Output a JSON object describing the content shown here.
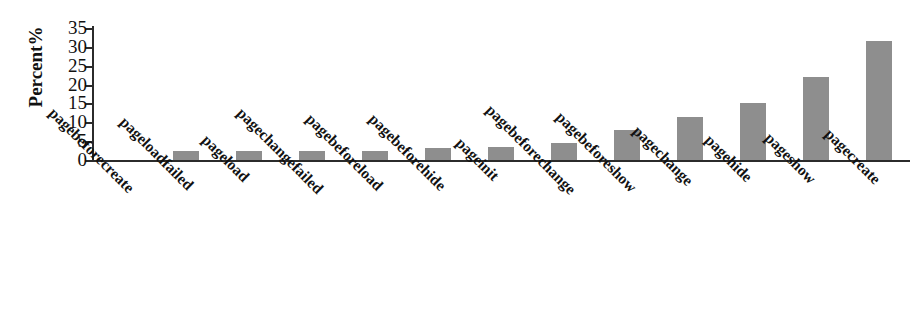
{
  "chart_data": {
    "type": "bar",
    "title": "",
    "xlabel": "",
    "ylabel": "Percent%",
    "ylim": [
      0,
      35
    ],
    "yticks": [
      0,
      5,
      10,
      15,
      20,
      25,
      30,
      35
    ],
    "grid": false,
    "legend": "none",
    "bar_color": "#8e8e8e",
    "axis_color": "#2b2b2b",
    "categories": [
      "pagebeforecreate",
      "pageloadfailed",
      "pageload",
      "pagechangefailed",
      "pagebeforeload",
      "pagebeforehide",
      "pageinit",
      "pagebeforechange",
      "pagebeforeshow",
      "pagechange",
      "pagehide",
      "pageshow",
      "pagecreate"
    ],
    "values": [
      0,
      2.5,
      2.5,
      2.5,
      2.5,
      3.2,
      3.5,
      4.5,
      8,
      11.5,
      15,
      22,
      31.5
    ]
  }
}
